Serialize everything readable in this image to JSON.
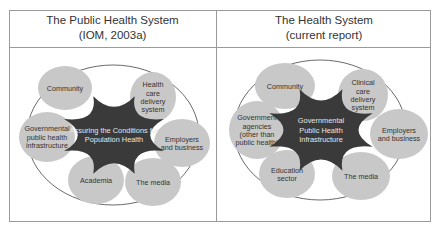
{
  "panels": [
    {
      "title": "The Public Health System",
      "subtitle": "(IOM, 2003a)",
      "center": [
        "Assuring the Conditions for",
        "Population Health"
      ],
      "nodes": [
        {
          "id": "community",
          "lines": [
            "Community"
          ]
        },
        {
          "id": "health-care-delivery-system",
          "lines": [
            "Health",
            "care",
            "delivery",
            "system"
          ]
        },
        {
          "id": "governmental-public-health-infrastructure",
          "lines": [
            "Governmental",
            "public health",
            "infrastructure"
          ]
        },
        {
          "id": "employers-and-business",
          "lines": [
            "Employers",
            "and business"
          ]
        },
        {
          "id": "academia",
          "lines": [
            "Academia"
          ]
        },
        {
          "id": "the-media",
          "lines": [
            "The media"
          ]
        }
      ]
    },
    {
      "title": "The Health System",
      "subtitle": "(current report)",
      "center": [
        "Governmental",
        "Public Health",
        "Infrastructure"
      ],
      "nodes": [
        {
          "id": "community",
          "lines": [
            "Community"
          ]
        },
        {
          "id": "clinical-care-delivery-system",
          "lines": [
            "Clinical",
            "care",
            "delivery",
            "system"
          ]
        },
        {
          "id": "government-agencies",
          "lines": [
            "Government",
            "agencies",
            "(other than",
            "public health)"
          ]
        },
        {
          "id": "employers-and-business",
          "lines": [
            "Employers",
            "and business"
          ]
        },
        {
          "id": "education-sector",
          "lines": [
            "Education",
            "sector"
          ]
        },
        {
          "id": "the-media",
          "lines": [
            "The media"
          ]
        }
      ]
    }
  ],
  "colors": {
    "node_fill": "#c8c8c8",
    "center_fill": "#3a3a3a",
    "center_text": "#e6e6e6",
    "node_text": "#333333",
    "ring": "#444444",
    "border": "#9a9a9a"
  }
}
